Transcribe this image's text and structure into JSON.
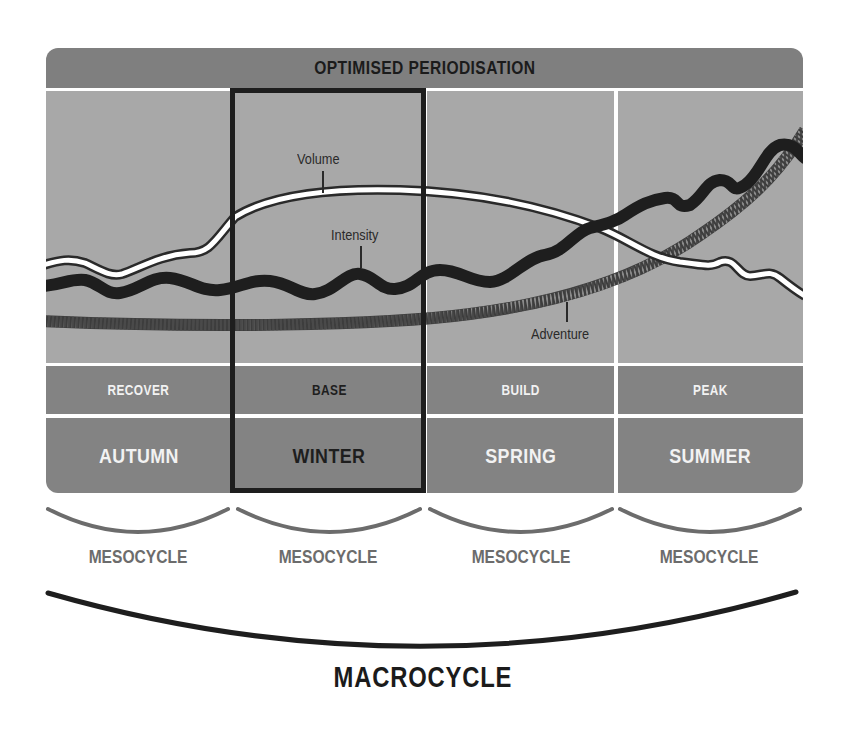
{
  "title": "OPTIMISED PERIODISATION",
  "colors": {
    "header_bg": "#7f7f7f",
    "chart_bg": "#a8a8a8",
    "label_row_bg": "#838383",
    "highlight_border": "#1e1e1e",
    "intensity_line": "#1e1e1e",
    "volume_line": "#ffffff",
    "adventure_line": "#5a5a5a"
  },
  "curves": {
    "volume_label": "Volume",
    "intensity_label": "Intensity",
    "adventure_label": "Adventure"
  },
  "columns": [
    {
      "phase": "RECOVER",
      "season": "AUTUMN",
      "highlighted": false
    },
    {
      "phase": "BASE",
      "season": "WINTER",
      "highlighted": true
    },
    {
      "phase": "BUILD",
      "season": "SPRING",
      "highlighted": false
    },
    {
      "phase": "PEAK",
      "season": "SUMMER",
      "highlighted": false
    }
  ],
  "mesocycles": [
    "MESOCYCLE",
    "MESOCYCLE",
    "MESOCYCLE",
    "MESOCYCLE"
  ],
  "macrocycle": "MACROCYCLE"
}
